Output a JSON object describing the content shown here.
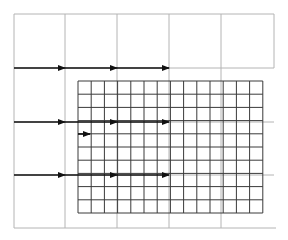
{
  "diagram": {
    "type": "coarse-fine grid with transfer arrows",
    "colors": {
      "background": "#ffffff",
      "coarse_line": "#b4b4b4",
      "fine_line": "#3a3a3a",
      "arrow": "#111111"
    },
    "coarse_grid": {
      "x_lines": [
        14,
        65,
        117,
        169,
        221,
        274
      ],
      "y_lines": [
        14,
        68,
        122,
        175,
        228
      ],
      "top_region_right": 274,
      "top_region_bottom": 68,
      "bottom_line_right": 276
    },
    "fine_grid": {
      "left": 78,
      "top": 81,
      "cols": 14,
      "rows": 10,
      "cell": 13.2
    },
    "arrows": [
      {
        "x1": 14,
        "y1": 68,
        "x2": 65,
        "y2": 68
      },
      {
        "x1": 65,
        "y1": 68,
        "x2": 117,
        "y2": 68
      },
      {
        "x1": 117,
        "y1": 68,
        "x2": 169,
        "y2": 68
      },
      {
        "x1": 14,
        "y1": 122,
        "x2": 65,
        "y2": 122
      },
      {
        "x1": 65,
        "y1": 122,
        "x2": 117,
        "y2": 122
      },
      {
        "x1": 117,
        "y1": 122,
        "x2": 169,
        "y2": 122
      },
      {
        "x1": 14,
        "y1": 175,
        "x2": 65,
        "y2": 175
      },
      {
        "x1": 65,
        "y1": 175,
        "x2": 117,
        "y2": 175
      },
      {
        "x1": 117,
        "y1": 175,
        "x2": 169,
        "y2": 175
      },
      {
        "x1": 78,
        "y1": 134,
        "x2": 90,
        "y2": 134
      }
    ]
  }
}
